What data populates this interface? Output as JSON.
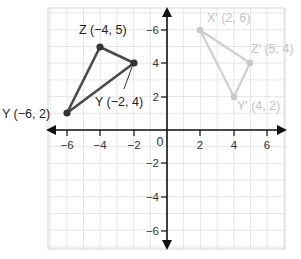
{
  "chart_data": {
    "type": "scatter",
    "title": "",
    "xlabel": "",
    "ylabel": "",
    "xlim": [
      -7,
      7
    ],
    "ylim": [
      -7,
      7
    ],
    "grid": true,
    "origin_label": "0",
    "x_ticks": [
      {
        "value": -6,
        "label": "−6"
      },
      {
        "value": -4,
        "label": "−4"
      },
      {
        "value": -2,
        "label": "−2"
      },
      {
        "value": 2,
        "label": "2"
      },
      {
        "value": 4,
        "label": "4"
      },
      {
        "value": 6,
        "label": "6"
      }
    ],
    "y_ticks": [
      {
        "value": 6,
        "label": "−6"
      },
      {
        "value": 4,
        "label": "4"
      },
      {
        "value": 2,
        "label": "2"
      },
      {
        "value": -2,
        "label": "−2"
      },
      {
        "value": -4,
        "label": "−4"
      },
      {
        "value": -6,
        "label": "−6"
      }
    ],
    "series": [
      {
        "name": "original-triangle",
        "color": "#444444",
        "points": [
          {
            "name": "Z",
            "x": -4,
            "y": 5,
            "label": "Z (−4, 5)"
          },
          {
            "name": "X",
            "x": -2,
            "y": 4,
            "label": "Y (−2, 4)"
          },
          {
            "name": "Y",
            "x": -6,
            "y": 2,
            "label": "Y (−6, 2)"
          }
        ]
      },
      {
        "name": "image-triangle",
        "color": "#cfcfcf",
        "points": [
          {
            "name": "X'",
            "x": 2,
            "y": 6,
            "label": "X′ (2, 6)"
          },
          {
            "name": "Z'",
            "x": 5,
            "y": 4,
            "label": "Z′ (5, 4)"
          },
          {
            "name": "Y'",
            "x": 4,
            "y": 2,
            "label": "Y′ (4, 2)"
          }
        ]
      }
    ]
  },
  "labels": {
    "z": "Z (−4, 5)",
    "x": "Y (−2, 4)",
    "y": "Y (−6, 2)",
    "xp": "X′ (2, 6)",
    "zp": "Z′ (5, 4)",
    "yp": "Y′ (4, 2)",
    "origin": "0",
    "xt_m6": "−6",
    "xt_m4": "−4",
    "xt_m2": "−2",
    "xt_2": "2",
    "xt_4": "4",
    "xt_6": "6",
    "yt_6": "−6",
    "yt_4": "4",
    "yt_2": "2",
    "yt_m2": "−2",
    "yt_m4": "−4",
    "yt_m6": "−6"
  }
}
